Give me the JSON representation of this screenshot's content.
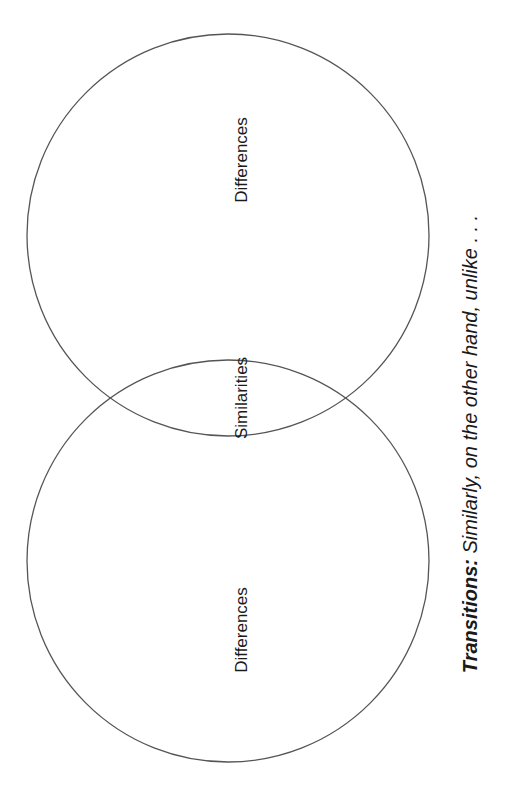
{
  "diagram": {
    "type": "venn",
    "orientation": "rotated-90",
    "circles": [
      {
        "id": "top",
        "cx": 228,
        "cy": 235,
        "r": 201,
        "stroke": "#555555"
      },
      {
        "id": "bottom",
        "cx": 228,
        "cy": 561,
        "r": 201,
        "stroke": "#555555"
      }
    ],
    "labels": {
      "top_region": "Differences",
      "overlap_region": "Similarities",
      "bottom_region": "Differences"
    },
    "transitions": {
      "heading": "Transitions:",
      "text": " Similarly, on the other hand, unlike . . ."
    }
  }
}
